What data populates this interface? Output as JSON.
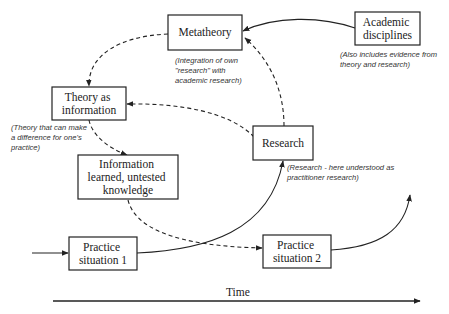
{
  "diagram": {
    "nodes": {
      "metatheory": {
        "lines": [
          "Metatheory"
        ]
      },
      "academic": {
        "lines": [
          "Academic",
          "disciplines"
        ]
      },
      "theory": {
        "lines": [
          "Theory as",
          "information"
        ]
      },
      "information": {
        "lines": [
          "Information",
          "learned, untested",
          "knowledge"
        ]
      },
      "research": {
        "lines": [
          "Research"
        ]
      },
      "practice1": {
        "lines": [
          "Practice",
          "situation 1"
        ]
      },
      "practice2": {
        "lines": [
          "Practice",
          "situation 2"
        ]
      }
    },
    "notes": {
      "metatheory": [
        "(Integration of own",
        "\"research\" with",
        "academic research)"
      ],
      "academic": [
        "(Also includes evidence from",
        "theory and research)"
      ],
      "theory": [
        "(Theory that can make",
        "a difference for one's",
        "practice)"
      ],
      "research": [
        "(Research - here understood as",
        "practitioner research)"
      ]
    },
    "axis": {
      "label": "Time"
    },
    "edges": [
      {
        "from": "academic",
        "to": "metatheory",
        "style": "solid"
      },
      {
        "from": "research",
        "to": "metatheory",
        "style": "dashed"
      },
      {
        "from": "metatheory",
        "to": "theory",
        "style": "dashed"
      },
      {
        "from": "research",
        "to": "theory",
        "style": "dashed"
      },
      {
        "from": "theory",
        "to": "information",
        "style": "dashed"
      },
      {
        "from": "information",
        "to": "practice2",
        "style": "dashed"
      },
      {
        "from": "practice1",
        "to": "research",
        "style": "solid"
      },
      {
        "from": "entry",
        "to": "practice1",
        "style": "solid"
      },
      {
        "from": "practice2",
        "to": "continuation",
        "style": "solid"
      }
    ]
  }
}
